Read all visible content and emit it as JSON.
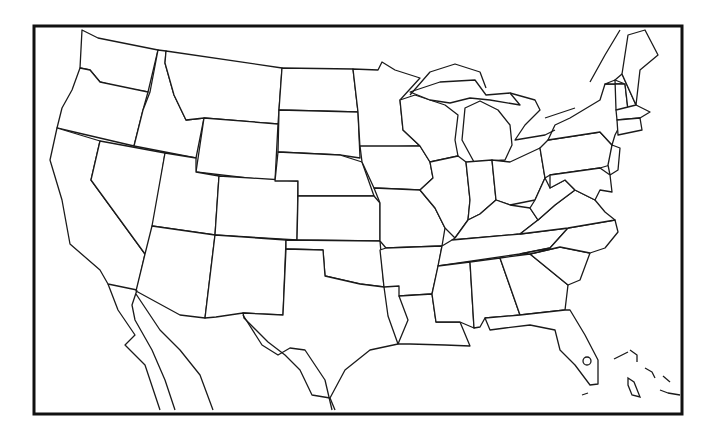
{
  "map": {
    "title": "Blank outline map of the contiguous United States",
    "style": {
      "background": "#ffffff",
      "line_color": "#1a1a1a",
      "frame_color": "#111111"
    },
    "frame": {
      "x": 34,
      "y": 26,
      "width": 648,
      "height": 388
    },
    "regions_shown": [
      "Contiguous United States (48 states)",
      "Northern Mexico incl. Baja California",
      "Southern Canada edge",
      "Bahamas / Cuba fragments"
    ],
    "labels": []
  }
}
